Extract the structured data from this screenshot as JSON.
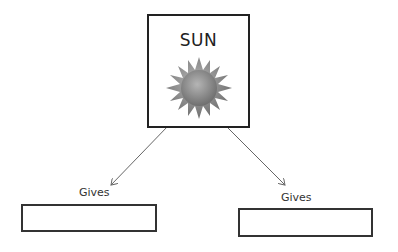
{
  "diagram": {
    "center": {
      "title": "SUN",
      "icon": "sun-icon",
      "sun_color": "#8a8a8a"
    },
    "branches": [
      {
        "label": "Gives",
        "answer": ""
      },
      {
        "label": "Gives",
        "answer": ""
      }
    ],
    "colors": {
      "border": "#222222",
      "arrow": "#666666",
      "background": "#ffffff"
    }
  }
}
